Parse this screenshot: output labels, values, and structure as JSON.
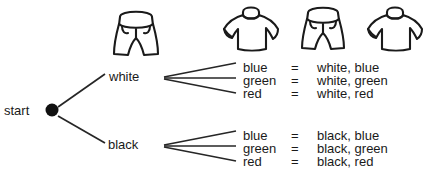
{
  "diagram": {
    "title_present": false,
    "root": {
      "label": "start",
      "node_type": "filled-dot"
    },
    "branches": [
      {
        "label": "white",
        "outcomes": [
          {
            "color": "blue",
            "equals": "=",
            "result": "white, blue"
          },
          {
            "color": "green",
            "equals": "=",
            "result": "white, green"
          },
          {
            "color": "red",
            "equals": "=",
            "result": "white, red"
          }
        ]
      },
      {
        "label": "black",
        "outcomes": [
          {
            "color": "blue",
            "equals": "=",
            "result": "black, blue"
          },
          {
            "color": "green",
            "equals": "=",
            "result": "black, green"
          },
          {
            "color": "red",
            "equals": "=",
            "result": "black, red"
          }
        ]
      }
    ],
    "icons": [
      {
        "name": "shorts-icon",
        "position": "stage-one-header"
      },
      {
        "name": "tshirt-icon",
        "position": "stage-two-header-left"
      },
      {
        "name": "shorts-icon",
        "position": "stage-two-header-middle"
      },
      {
        "name": "tshirt-icon",
        "position": "stage-two-header-right"
      }
    ],
    "colors": {
      "ink": "#1a1a1a",
      "line": "#262626",
      "background": "#ffffff"
    }
  }
}
